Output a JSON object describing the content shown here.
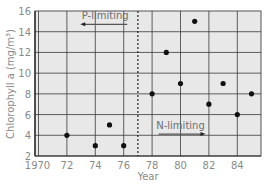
{
  "chart_data": {
    "type": "scatter",
    "title": "",
    "xlabel": "Year",
    "ylabel": "Chlorophyll a (mg/m³)",
    "xlim": [
      1969.8,
      1985.8
    ],
    "ylim": [
      2,
      16
    ],
    "x_ticks": [
      1970,
      1972,
      1974,
      1976,
      1978,
      1980,
      1982,
      1984
    ],
    "x_tick_labels": [
      "1970",
      "72",
      "74",
      "76",
      "78",
      "80",
      "82",
      "84"
    ],
    "y_ticks": [
      2,
      4,
      6,
      8,
      10,
      12,
      14,
      16
    ],
    "y_tick_labels": [
      "2",
      "4",
      "6",
      "8",
      "10",
      "12",
      "14",
      "16"
    ],
    "grid": true,
    "series": [
      {
        "name": "Chlorophyll a",
        "x": [
          1972,
          1974,
          1975,
          1976,
          1978,
          1979,
          1980,
          1981,
          1982,
          1983,
          1984,
          1985
        ],
        "y": [
          4,
          3,
          5,
          3,
          8,
          12,
          9,
          15,
          7,
          9,
          6,
          8
        ]
      }
    ],
    "reference_line": {
      "orientation": "vertical",
      "x": 1977,
      "style": "dashed"
    },
    "annotations": [
      {
        "text": "P-limiting",
        "x": 1974.7,
        "y": 15.2,
        "arrow": "left"
      },
      {
        "text": "N-limiting",
        "x": 1980.0,
        "y": 4.6,
        "arrow": "right"
      }
    ],
    "colors": {
      "plot_background": "#e8e8e8",
      "grid": "#3a3a3a",
      "points": "#111111",
      "text": "#8a8a8a"
    }
  }
}
